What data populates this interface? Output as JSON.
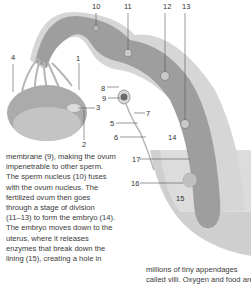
{
  "figure": {
    "labels": [
      {
        "n": "1",
        "x": 76,
        "y": 55
      },
      {
        "n": "2",
        "x": 82,
        "y": 141
      },
      {
        "n": "3",
        "x": 96,
        "y": 104
      },
      {
        "n": "4",
        "x": 11,
        "y": 54
      },
      {
        "n": "5",
        "x": 110,
        "y": 120
      },
      {
        "n": "6",
        "x": 114,
        "y": 134
      },
      {
        "n": "7",
        "x": 146,
        "y": 110
      },
      {
        "n": "8",
        "x": 101,
        "y": 85
      },
      {
        "n": "9",
        "x": 102,
        "y": 95
      },
      {
        "n": "10",
        "x": 92,
        "y": 3
      },
      {
        "n": "11",
        "x": 124,
        "y": 3
      },
      {
        "n": "12",
        "x": 163,
        "y": 3
      },
      {
        "n": "13",
        "x": 182,
        "y": 3
      },
      {
        "n": "14",
        "x": 168,
        "y": 134
      },
      {
        "n": "15",
        "x": 176,
        "y": 195
      },
      {
        "n": "16",
        "x": 131,
        "y": 180
      },
      {
        "n": "17",
        "x": 132,
        "y": 156
      }
    ],
    "colors": {
      "tube_dark": "#9a9a9a",
      "tube_light": "#c9c9c9",
      "uterus_fill": "#bdbdbd",
      "ovary": "#a8a8a8",
      "text": "#3a3a3a"
    }
  },
  "text_left": {
    "lines": [
      "membrane (9), making the ovum",
      "impenetrable to other sperm.",
      "The sperm nucleus (10) fuses",
      "with the ovum nucleus. The",
      "fertilized ovum then goes",
      "through a stage of division",
      "(11–13) to form the embryo (14).",
      "The embryo moves down to the",
      "uterus, where it releases",
      "enzymes that break down the",
      "lining (15), creating a hole in"
    ]
  },
  "text_right": {
    "lines": [
      "millions of tiny appendages",
      "called villi. Oxygen and food are"
    ]
  }
}
